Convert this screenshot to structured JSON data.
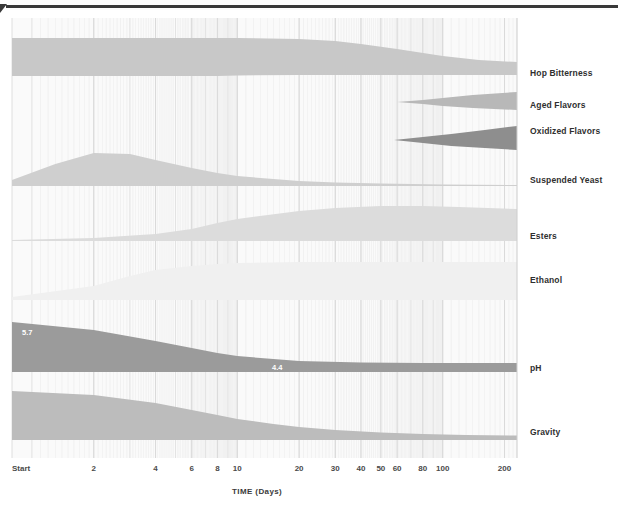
{
  "chart_data": {
    "type": "area",
    "title": "",
    "xlabel": "TIME (Days)",
    "ylabel": "",
    "x_scale": "log",
    "grid": true,
    "legend_position": "right-inline",
    "x_ticks": [
      {
        "label": "Start",
        "value": 0.8,
        "major": true
      },
      {
        "label": "2",
        "value": 2,
        "major": true
      },
      {
        "label": "4",
        "value": 4,
        "major": true
      },
      {
        "label": "6",
        "value": 6,
        "major": true
      },
      {
        "label": "8",
        "value": 8,
        "major": true
      },
      {
        "label": "10",
        "value": 10,
        "major": true
      },
      {
        "label": "20",
        "value": 20,
        "major": true
      },
      {
        "label": "30",
        "value": 30,
        "major": true
      },
      {
        "label": "40",
        "value": 40,
        "major": true
      },
      {
        "label": "50",
        "value": 50,
        "major": true
      },
      {
        "label": "60",
        "value": 60,
        "major": true
      },
      {
        "label": "80",
        "value": 80,
        "major": true
      },
      {
        "label": "100",
        "value": 100,
        "major": true
      },
      {
        "label": "200",
        "value": 200,
        "major": true
      }
    ],
    "xlim": [
      0.8,
      230
    ],
    "series": [
      {
        "name": "Hop Bitterness",
        "color": "#c8c8c8",
        "label_y": 73,
        "x": [
          0.8,
          2,
          4,
          6,
          8,
          10,
          20,
          30,
          40,
          60,
          100,
          150,
          230
        ],
        "thickness": [
          38,
          38,
          38,
          38,
          38,
          37.5,
          36,
          34,
          31,
          26,
          19,
          15,
          13
        ],
        "top": [
          38,
          38,
          38,
          38,
          38,
          38,
          39,
          41,
          44,
          49,
          56,
          60,
          62
        ]
      },
      {
        "name": "Aged Flavors",
        "color": "#b8b8b8",
        "label_y": 105,
        "x": [
          60,
          80,
          100,
          140,
          230
        ],
        "thickness": [
          0,
          4,
          8,
          13,
          18
        ],
        "top": [
          102,
          100,
          98,
          95,
          92
        ]
      },
      {
        "name": "Oxidized Flavors",
        "color": "#8e8e8e",
        "label_y": 131,
        "x": [
          58,
          80,
          110,
          160,
          230
        ],
        "thickness": [
          0,
          6,
          12,
          18,
          24
        ],
        "top": [
          140,
          137,
          134,
          130,
          126
        ]
      },
      {
        "name": "Suspended Yeast",
        "color": "#cfcfcf",
        "label_y": 180,
        "x": [
          0.8,
          1.3,
          2,
          3,
          4,
          6,
          8,
          10,
          15,
          20,
          30,
          50,
          100,
          230
        ],
        "thickness": [
          6,
          22,
          33,
          32,
          26,
          18,
          13,
          10,
          7,
          5,
          3.5,
          2.5,
          1.6,
          1
        ],
        "top": [
          180,
          164,
          153,
          154,
          160,
          168,
          173,
          176,
          179,
          181,
          182.5,
          183.5,
          184.4,
          185
        ]
      },
      {
        "name": "Esters",
        "color": "#dcdcdc",
        "label_y": 236,
        "x": [
          0.8,
          2,
          4,
          6,
          8,
          10,
          20,
          30,
          50,
          80,
          120,
          230
        ],
        "thickness": [
          1,
          3,
          7,
          12,
          18,
          22,
          30,
          33,
          35,
          35,
          34,
          32
        ],
        "top": [
          240,
          238,
          234,
          229,
          223,
          219,
          211,
          208,
          206,
          206,
          207,
          209
        ]
      },
      {
        "name": "Ethanol",
        "color": "#f0f0f0",
        "label_y": 280,
        "x": [
          0.8,
          2,
          3,
          4,
          6,
          8,
          10,
          20,
          40,
          100,
          230
        ],
        "thickness": [
          3,
          14,
          24,
          30,
          34,
          36,
          37,
          38,
          38,
          38,
          38
        ],
        "top": [
          297,
          286,
          276,
          270,
          266,
          264,
          263,
          262,
          262,
          262,
          262
        ]
      },
      {
        "name": "pH",
        "color": "#9b9b9b",
        "label_y": 368,
        "value_labels": [
          {
            "text": "5.7",
            "x": 22,
            "y": 329
          },
          {
            "text": "4.4",
            "x": 272,
            "y": 364
          }
        ],
        "x": [
          0.8,
          2,
          4,
          6,
          8,
          10,
          15,
          20,
          40,
          80,
          230
        ],
        "thickness": [
          50,
          42,
          31,
          24,
          19,
          16,
          13,
          11,
          9.5,
          9,
          9
        ],
        "top": [
          322,
          330,
          341,
          348,
          353,
          356,
          359,
          361,
          362.5,
          363,
          363
        ]
      },
      {
        "name": "Gravity",
        "color": "#bcbcbc",
        "label_y": 432,
        "x": [
          0.8,
          2,
          4,
          6,
          8,
          10,
          15,
          20,
          30,
          50,
          80,
          130,
          230
        ],
        "thickness": [
          49,
          45,
          37,
          30,
          25,
          21,
          16,
          13,
          10,
          7.5,
          6,
          5,
          4.5
        ],
        "top": [
          391,
          395,
          403,
          410,
          415,
          419,
          424,
          427,
          430,
          432.5,
          434,
          435,
          435.5
        ]
      }
    ]
  },
  "plot": {
    "left": 12,
    "right": 517,
    "top": 18,
    "bottom": 458,
    "background": "#fafafa",
    "grid_color": "#d7d7d7",
    "border_color": "#cfcfcf"
  },
  "axis": {
    "title": "TIME (Days)",
    "title_x": 232,
    "title_y": 488,
    "tick_label_y": 465
  },
  "decor": {
    "top_rule_color": "#3a3a3a"
  }
}
